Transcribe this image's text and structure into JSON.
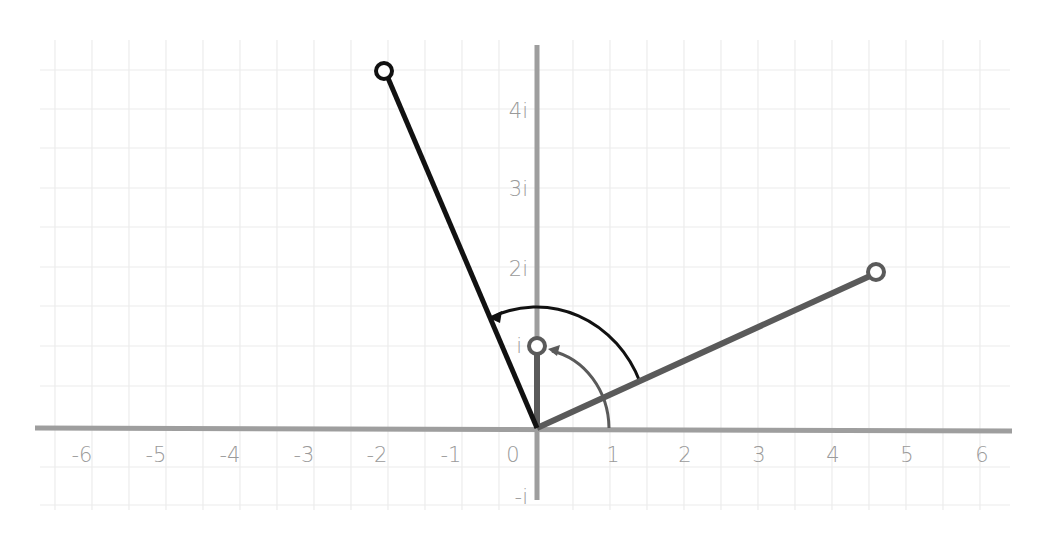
{
  "diagram": {
    "origin_px": [
      536,
      428
    ],
    "unit_x_px": 74,
    "unit_y_px": 79,
    "x_ticks": [
      "-6",
      "-5",
      "-4",
      "-3",
      "-2",
      "-1",
      "0",
      "1",
      "2",
      "3",
      "4",
      "5",
      "6"
    ],
    "y_ticks": [
      "4i",
      "3i",
      "2i",
      "i",
      "-i"
    ],
    "colors": {
      "grid": "#ececec",
      "axis": "#9e9e9e",
      "dark_vector": "#111111",
      "gray_vector": "#5a5a5a",
      "label": "#9a9a9a"
    },
    "vectors": [
      {
        "name": "i",
        "re": 0,
        "im": 1,
        "color": "gray"
      },
      {
        "name": "z",
        "re": 4.5,
        "im": 2,
        "color": "gray"
      },
      {
        "name": "iz",
        "re": -2,
        "im": 4.5,
        "color": "dark"
      }
    ],
    "arcs": [
      {
        "from": "positive real axis",
        "to": "i",
        "angle_deg": 90,
        "color": "gray"
      },
      {
        "from": "z",
        "to": "iz",
        "angle_deg": 90,
        "color": "dark"
      }
    ]
  }
}
